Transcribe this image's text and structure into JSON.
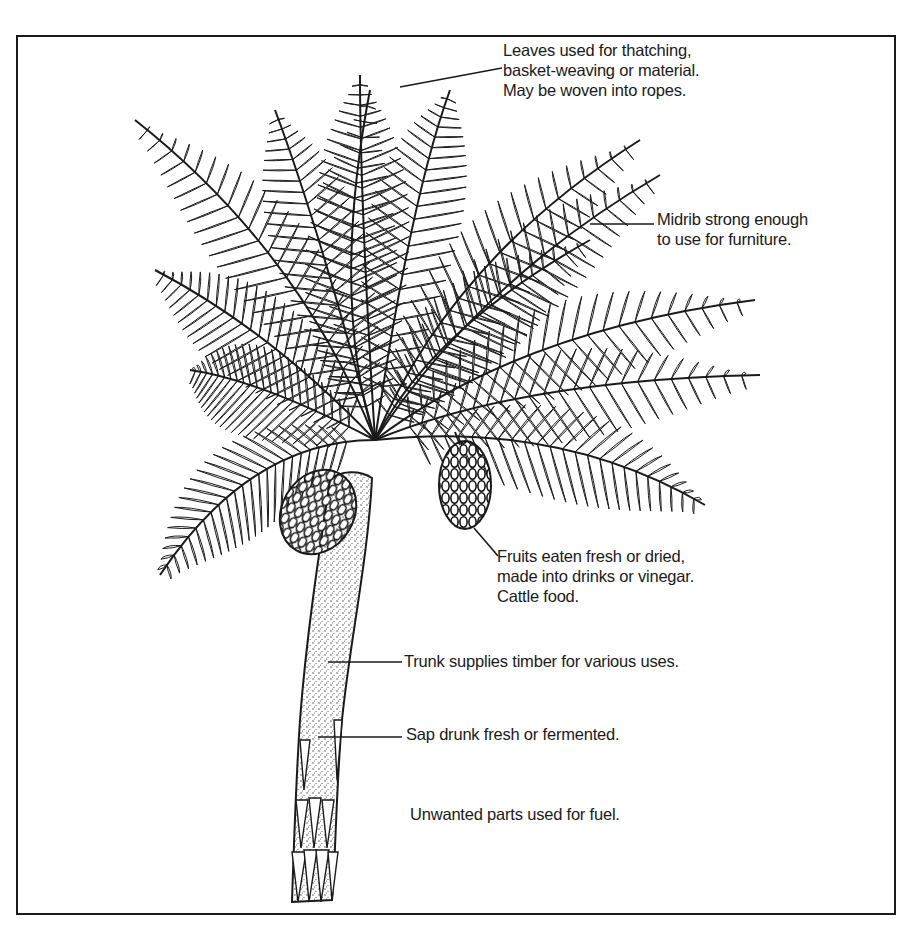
{
  "diagram": {
    "colors": {
      "ink": "#1a1a1a",
      "background": "#ffffff"
    },
    "annotations": [
      {
        "id": "leaves",
        "target": "leaves",
        "lines": [
          "Leaves used for thatching,",
          "basket-weaving or material.",
          "May be woven into ropes."
        ]
      },
      {
        "id": "midrib",
        "target": "midrib",
        "lines": [
          "Midrib strong enough",
          "to use for furniture."
        ]
      },
      {
        "id": "fruits",
        "target": "fruit cluster",
        "lines": [
          "Fruits eaten fresh or dried,",
          "made into drinks or vinegar.",
          "Cattle food."
        ]
      },
      {
        "id": "trunk",
        "target": "trunk",
        "lines": [
          "Trunk supplies timber for various uses."
        ]
      },
      {
        "id": "sap",
        "target": "trunk",
        "lines": [
          "Sap drunk fresh or fermented."
        ]
      },
      {
        "id": "fuel",
        "target": "whole plant",
        "lines": [
          "Unwanted parts used for fuel."
        ]
      }
    ]
  }
}
